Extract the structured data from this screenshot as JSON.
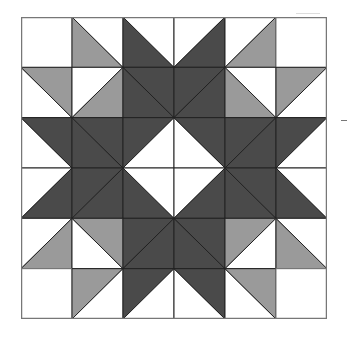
{
  "figure": {
    "type": "quilt-block-pattern",
    "grid": {
      "rows": 6,
      "cols": 6
    },
    "colors": {
      "white": "#ffffff",
      "light": "#9a9a9a",
      "dark": "#4a4a4a",
      "line": "#222222",
      "border": "#777777"
    },
    "cells": [
      [
        {
          "diag": "none",
          "a": "white",
          "b": "white"
        },
        {
          "diag": "\\",
          "a": "light",
          "b": "white"
        },
        {
          "diag": "\\",
          "a": "dark",
          "b": "white"
        },
        {
          "diag": "/",
          "a": "white",
          "b": "dark"
        },
        {
          "diag": "/",
          "a": "white",
          "b": "light"
        },
        {
          "diag": "none",
          "a": "white",
          "b": "white"
        }
      ],
      [
        {
          "diag": "\\",
          "a": "white",
          "b": "light"
        },
        {
          "diag": "/",
          "a": "white",
          "b": "light"
        },
        {
          "diag": "\\",
          "a": "dark",
          "b": "dark"
        },
        {
          "diag": "/",
          "a": "dark",
          "b": "dark"
        },
        {
          "diag": "\\",
          "a": "light",
          "b": "white"
        },
        {
          "diag": "/",
          "a": "light",
          "b": "white"
        }
      ],
      [
        {
          "diag": "\\",
          "a": "white",
          "b": "dark"
        },
        {
          "diag": "\\",
          "a": "dark",
          "b": "dark"
        },
        {
          "diag": "/",
          "a": "dark",
          "b": "white"
        },
        {
          "diag": "\\",
          "a": "white",
          "b": "dark"
        },
        {
          "diag": "/",
          "a": "dark",
          "b": "dark"
        },
        {
          "diag": "/",
          "a": "dark",
          "b": "white"
        }
      ],
      [
        {
          "diag": "/",
          "a": "white",
          "b": "dark"
        },
        {
          "diag": "/",
          "a": "dark",
          "b": "dark"
        },
        {
          "diag": "\\",
          "a": "dark",
          "b": "white"
        },
        {
          "diag": "/",
          "a": "white",
          "b": "dark"
        },
        {
          "diag": "\\",
          "a": "dark",
          "b": "dark"
        },
        {
          "diag": "\\",
          "a": "dark",
          "b": "white"
        }
      ],
      [
        {
          "diag": "/",
          "a": "white",
          "b": "light"
        },
        {
          "diag": "\\",
          "a": "white",
          "b": "light"
        },
        {
          "diag": "/",
          "a": "dark",
          "b": "dark"
        },
        {
          "diag": "\\",
          "a": "dark",
          "b": "dark"
        },
        {
          "diag": "/",
          "a": "light",
          "b": "white"
        },
        {
          "diag": "\\",
          "a": "light",
          "b": "white"
        }
      ],
      [
        {
          "diag": "none",
          "a": "white",
          "b": "white"
        },
        {
          "diag": "/",
          "a": "light",
          "b": "white"
        },
        {
          "diag": "/",
          "a": "dark",
          "b": "white"
        },
        {
          "diag": "\\",
          "a": "white",
          "b": "dark"
        },
        {
          "diag": "\\",
          "a": "white",
          "b": "light"
        },
        {
          "diag": "none",
          "a": "white",
          "b": "white"
        }
      ]
    ],
    "legend_note": "For '\\' diagonals: a = lower-left triangle, b = upper-right triangle. For '/' diagonals: a = upper-left triangle, b = lower-right triangle."
  }
}
